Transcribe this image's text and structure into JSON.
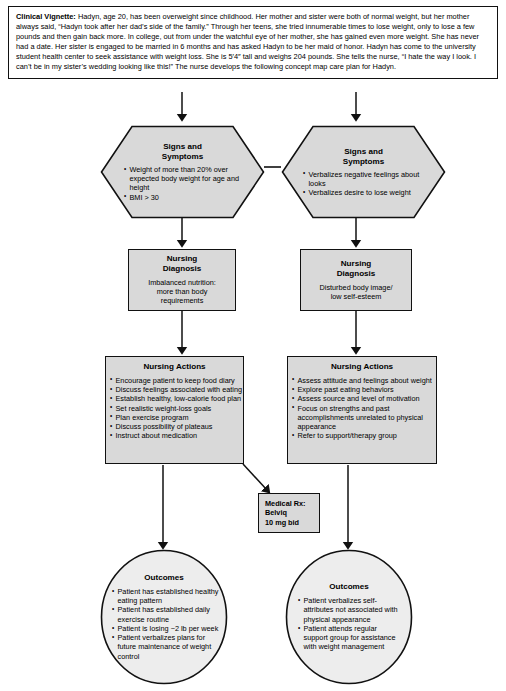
{
  "page": {
    "background": "#ffffff",
    "node_fill": "#d9d9d9",
    "node_stroke": "#111111",
    "line_color": "#111111"
  },
  "vignette": {
    "label": "Clinical Vignette:",
    "text": " Hadyn, age 20, has been overweight since childhood. Her mother and sister were both of normal weight, but her mother always said, “Hadyn took after her dad’s side of the family.” Through her teens, she tried innumerable times to lose weight, only to lose a few pounds and then gain back more. In college, out from under the watchful eye of her mother, she has gained even more weight. She has never had a date. Her sister is engaged to be married in 6 months and has asked Hadyn to be her maid of honor. Hadyn has come to the university student health center to seek assistance with weight loss. She is 5′4″ tall and weighs 204 pounds. She tells the nurse, “I hate the way I look. I can’t be in my sister’s wedding looking like this!” The nurse develops the following concept map care plan for Hadyn."
  },
  "signs_left": {
    "header_line1": "Signs and",
    "header_line2": "Symptoms",
    "items": [
      "Weight of more than 20% over expected body weight for age and height",
      "BMI > 30"
    ]
  },
  "signs_right": {
    "header_line1": "Signs and",
    "header_line2": "Symptoms",
    "items": [
      "Verbalizes negative feelings about looks",
      "Verbalizes desire to lose weight"
    ]
  },
  "diagnosis_left": {
    "header_line1": "Nursing",
    "header_line2": "Diagnosis",
    "body_line1": "Imbalanced nutrition:",
    "body_line2": "more than body",
    "body_line3": "requirements"
  },
  "diagnosis_right": {
    "header_line1": "Nursing",
    "header_line2": "Diagnosis",
    "body_line1": "Disturbed body image/",
    "body_line2": "low self-esteem",
    "body_line3": ""
  },
  "actions_left": {
    "header": "Nursing Actions",
    "items": [
      "Encourage patient to keep food diary",
      "Discuss feelings associated with eating",
      "Establish healthy, low-calorie food plan",
      "Set realistic weight-loss goals",
      "Plan exercise program",
      "Discuss possibility of plateaus",
      "Instruct about medication"
    ]
  },
  "actions_right": {
    "header": "Nursing Actions",
    "items": [
      "Assess attitude and feelings about weight",
      "Explore past eating behaviors",
      "Assess source and level of motivation",
      "Focus on strengths and past accomplishments unrelated to physical appearance",
      "Refer to support/therapy group"
    ]
  },
  "medical_rx": {
    "line1": "Medical Rx:",
    "line2": "Belviq",
    "line3": "10 mg bid"
  },
  "outcomes_left": {
    "header": "Outcomes",
    "items": [
      "Patient has established healthy eating pattern",
      "Patient has established daily exercise routine",
      "Patient is losing ~2 lb per week",
      "Patient verbalizes plans for future maintenance of weight control"
    ]
  },
  "outcomes_right": {
    "header": "Outcomes",
    "items": [
      "Patient verbalizes self-attributes not associated with physical appearance",
      "Patient attends regular support group for assistance with weight management"
    ]
  }
}
